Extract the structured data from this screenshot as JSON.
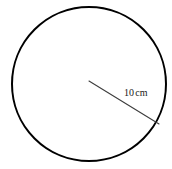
{
  "figure": {
    "type": "geometry-diagram",
    "background_color": "#ffffff",
    "canvas": {
      "width": 172,
      "height": 169
    },
    "circle": {
      "name": "circle-outline",
      "center_x": 89,
      "center_y": 84,
      "radius": 77,
      "stroke_color": "#000000",
      "stroke_width": 2,
      "fill": "none"
    },
    "radius_segment": {
      "name": "radius-line",
      "x1": 89,
      "y1": 81,
      "x2": 159,
      "y2": 124,
      "stroke_color": "#3d3d3d",
      "stroke_width": 1
    },
    "labels": {
      "radius": {
        "value": "10",
        "unit": "cm",
        "full_text": "10 cm",
        "x": 124,
        "y": 87,
        "color": "#1a1a1a",
        "font_size": 10
      }
    }
  }
}
